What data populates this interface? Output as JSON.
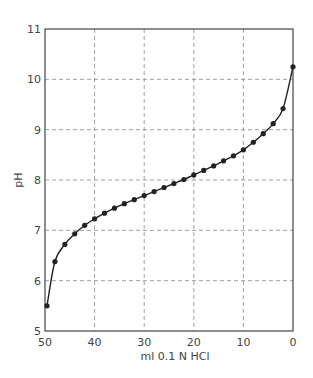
{
  "chart_data": {
    "type": "line",
    "title": "",
    "xlabel": "ml 0.1 N HCl",
    "ylabel": "pH",
    "xlim": [
      50,
      0
    ],
    "ylim": [
      5,
      11
    ],
    "x_reversed": true,
    "grid": true,
    "grid_style": "dashed",
    "legend": null,
    "x_ticks": [
      50,
      40,
      30,
      20,
      10,
      0
    ],
    "y_ticks": [
      5,
      6,
      7,
      8,
      9,
      10,
      11
    ],
    "x_tick_labels": [
      "50",
      "40",
      "30",
      "20",
      "10",
      "0"
    ],
    "y_tick_labels": [
      "5",
      "6",
      "7",
      "8",
      "9",
      "10",
      "11"
    ],
    "series": [
      {
        "name": "titration curve",
        "marker": "circle",
        "x": [
          49.6,
          48,
          46,
          44,
          42,
          40,
          38,
          36,
          34,
          32,
          30,
          28,
          26,
          24,
          22,
          20,
          18,
          16,
          14,
          12,
          10,
          8,
          6,
          4,
          2,
          0
        ],
        "y": [
          5.5,
          6.38,
          6.72,
          6.93,
          7.1,
          7.23,
          7.34,
          7.44,
          7.53,
          7.61,
          7.69,
          7.77,
          7.85,
          7.93,
          8.01,
          8.1,
          8.19,
          8.28,
          8.38,
          8.48,
          8.6,
          8.75,
          8.92,
          9.12,
          9.42,
          10.25
        ]
      }
    ]
  },
  "plot_area": {
    "left": 45,
    "top": 29,
    "right": 293,
    "bottom": 331
  },
  "colors": {
    "axis": "#444444",
    "grid": "#888888",
    "line": "#222222",
    "marker": "#222222"
  }
}
